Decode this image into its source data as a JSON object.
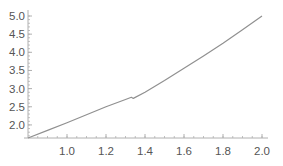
{
  "chart_data": {
    "type": "line",
    "title": "",
    "xlabel": "",
    "ylabel": "",
    "xlim": [
      0.8,
      2.0
    ],
    "ylim": [
      1.64,
      5.0
    ],
    "grid": false,
    "legend": null,
    "x_ticks": [
      "1.0",
      "1.2",
      "1.4",
      "1.6",
      "1.8",
      "2.0"
    ],
    "y_ticks": [
      "2.0",
      "2.5",
      "3.0",
      "3.5",
      "4.0",
      "4.5",
      "5.0"
    ],
    "series": [
      {
        "name": "curve",
        "color": "#909090",
        "x": [
          0.8,
          0.9,
          1.0,
          1.1,
          1.2,
          1.3,
          1.33,
          1.34,
          1.4,
          1.5,
          1.6,
          1.7,
          1.8,
          1.9,
          2.0
        ],
        "y": [
          1.64,
          1.85,
          2.06,
          2.28,
          2.5,
          2.7,
          2.76,
          2.73,
          2.9,
          3.22,
          3.56,
          3.9,
          4.25,
          4.62,
          5.0
        ]
      }
    ],
    "annotations": []
  }
}
